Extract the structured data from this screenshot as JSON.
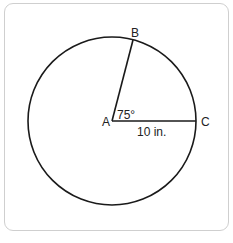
{
  "diagram": {
    "type": "circle-sector",
    "points": {
      "center": "A",
      "point_on_circle_1": "B",
      "point_on_circle_2": "C"
    },
    "labels": {
      "A": "A",
      "B": "B",
      "C": "C",
      "angle": "75°",
      "radius": "10 in."
    },
    "angle_BAC_degrees": 75,
    "radius_AC": "10 in.",
    "colors": {
      "stroke": "#1a1a1a",
      "frame_border": "#cfcfcf",
      "background": "#ffffff"
    }
  }
}
